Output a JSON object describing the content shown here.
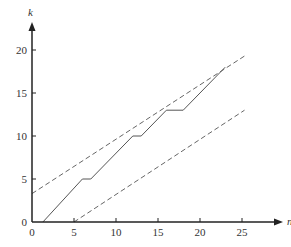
{
  "chart_data": {
    "type": "line",
    "title": "",
    "xlabel": "n",
    "ylabel": "k",
    "xlim": [
      0,
      27
    ],
    "ylim": [
      0,
      22
    ],
    "x_ticks": [
      0,
      5,
      10,
      15,
      20,
      25
    ],
    "y_ticks": [
      0,
      5,
      10,
      15,
      20
    ],
    "grid": false,
    "legend": null,
    "series": [
      {
        "name": "staircase",
        "style": "solid",
        "points": [
          [
            1.3,
            0
          ],
          [
            6,
            5
          ],
          [
            7,
            5
          ],
          [
            12,
            10
          ],
          [
            13,
            10
          ],
          [
            16,
            13
          ],
          [
            18,
            13
          ],
          [
            23,
            18
          ]
        ]
      },
      {
        "name": "upper bound",
        "style": "dashed",
        "points": [
          [
            0,
            3.3
          ],
          [
            25.3,
            19.3
          ]
        ]
      },
      {
        "name": "lower bound",
        "style": "dashed",
        "points": [
          [
            5,
            0
          ],
          [
            25.3,
            13
          ]
        ]
      }
    ]
  },
  "axes": {
    "x_label": "n",
    "y_label": "k",
    "x_tick_labels": [
      "0",
      "5",
      "10",
      "15",
      "20",
      "25"
    ],
    "y_tick_labels": [
      "0",
      "5",
      "10",
      "15",
      "20"
    ]
  }
}
